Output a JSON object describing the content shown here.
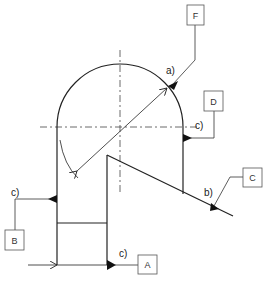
{
  "diagram": {
    "type": "weld-symbol technical drawing",
    "colors": {
      "line": "#222222",
      "background": "#ffffff",
      "box_border": "#555555"
    },
    "callouts": [
      {
        "id": "F",
        "box_label": "F",
        "annotation": "a)"
      },
      {
        "id": "D",
        "box_label": "D",
        "annotation": "c)"
      },
      {
        "id": "C",
        "box_label": "C",
        "annotation": "b)"
      },
      {
        "id": "B",
        "box_label": "B",
        "annotation": "c)"
      },
      {
        "id": "A",
        "box_label": "A",
        "annotation": "c)"
      }
    ]
  }
}
